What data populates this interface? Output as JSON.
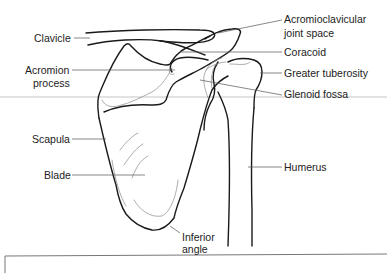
{
  "figure": {
    "colors": {
      "outline": "#1a1a1a",
      "detail_lines": "#8a8a8a",
      "leader_lines": "#555555",
      "label_text": "#222222",
      "background": "#ffffff"
    }
  },
  "labels": {
    "clavicle": "Clavicle",
    "acromion_line1": "Acromion",
    "acromion_line2": "process",
    "scapula": "Scapula",
    "blade": "Blade",
    "ac_joint_line1": "Acromioclavicular",
    "ac_joint_line2": "joint space",
    "coracoid": "Coracoid",
    "greater_tuberosity": "Greater tuberosity",
    "glenoid_fossa": "Glenoid fossa",
    "humerus": "Humerus",
    "inferior_angle_line1": "Inferior",
    "inferior_angle_line2": "angle"
  }
}
